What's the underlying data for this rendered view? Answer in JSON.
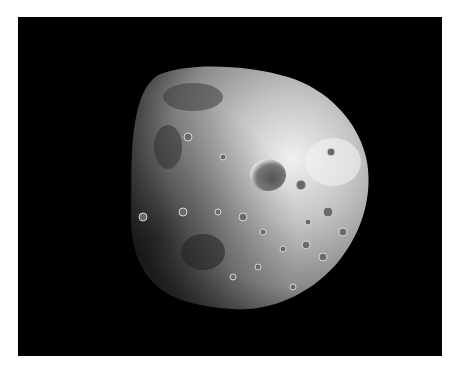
{
  "image": {
    "subject": "cratered irregular moon on black space background",
    "background_color": "#000000",
    "border_color": "#ffffff",
    "colors": {
      "surface_light": "#e8e8e8",
      "surface_mid": "#9a9a9a",
      "surface_dark": "#3a3a3a"
    }
  }
}
